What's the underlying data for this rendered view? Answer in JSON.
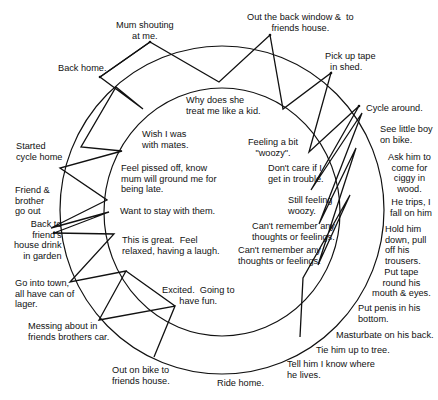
{
  "diagram": {
    "type": "cycle-diagram",
    "outer_ring_label_role": "behaviours / events",
    "inner_ring_label_role": "thoughts / feelings",
    "line_color": "#111111",
    "background": "#ffffff",
    "outer_events": [
      {
        "id": "o1",
        "text": "Out the back window &  to\nfriends house."
      },
      {
        "id": "o2",
        "text": "Pick up tape\n  in shed."
      },
      {
        "id": "o3",
        "text": "Cycle around."
      },
      {
        "id": "o4",
        "text": "See little boy\non bike."
      },
      {
        "id": "o5",
        "text": "Ask him to\ncome for\nciggy in\nwood."
      },
      {
        "id": "o6",
        "text": "He trips, I\nfall on him"
      },
      {
        "id": "o7",
        "text": "Hold him\ndown, pull\noff his\ntrousers."
      },
      {
        "id": "o8",
        "text": "Put tape\nround his\nmouth & eyes."
      },
      {
        "id": "o9",
        "text": "Put penis in his\nbottom."
      },
      {
        "id": "o10",
        "text": "Masturbate on his back."
      },
      {
        "id": "o11",
        "text": "Tie him up to tree."
      },
      {
        "id": "o12",
        "text": "Tell him I know where\nhe lives."
      },
      {
        "id": "o13",
        "text": "Ride home."
      },
      {
        "id": "o14",
        "text": "Out on bike to\nfriends house."
      },
      {
        "id": "o15",
        "text": "Messing about in\nfriends brothers car."
      },
      {
        "id": "o16",
        "text": "Go into town,\nall have can of\nlager."
      },
      {
        "id": "o17",
        "text": "Back to\nfriend's\nhouse drink\nin garden"
      },
      {
        "id": "o18",
        "text": "Friend &\nbrother\ngo out"
      },
      {
        "id": "o19",
        "text": "Started\ncycle home"
      },
      {
        "id": "o20",
        "text": "Back home."
      },
      {
        "id": "o21",
        "text": "Mum shouting\nat me."
      }
    ],
    "inner_feelings": [
      {
        "id": "i1",
        "text": "Why does she\ntreat me like a kid."
      },
      {
        "id": "i2",
        "text": "Feeling a bit\n\"woozy\"."
      },
      {
        "id": "i3",
        "text": "Don't care if I\nget in trouble."
      },
      {
        "id": "i4",
        "text": "Still feeling\nwoozy."
      },
      {
        "id": "i5",
        "text": "Can't remember any\nthoughts or feelings."
      },
      {
        "id": "i6",
        "text": "Can't remember any\nthoughts or feelings."
      },
      {
        "id": "i7",
        "text": "Excited.  Going to\nhave fun."
      },
      {
        "id": "i8",
        "text": "This is great.  Feel\nrelaxed, having a laugh."
      },
      {
        "id": "i9",
        "text": "Want to stay with them."
      },
      {
        "id": "i10",
        "text": "Feel pissed off, know\nmum will ground me for\nbeing late."
      },
      {
        "id": "i11",
        "text": "Wish I was\nwith mates."
      }
    ]
  }
}
